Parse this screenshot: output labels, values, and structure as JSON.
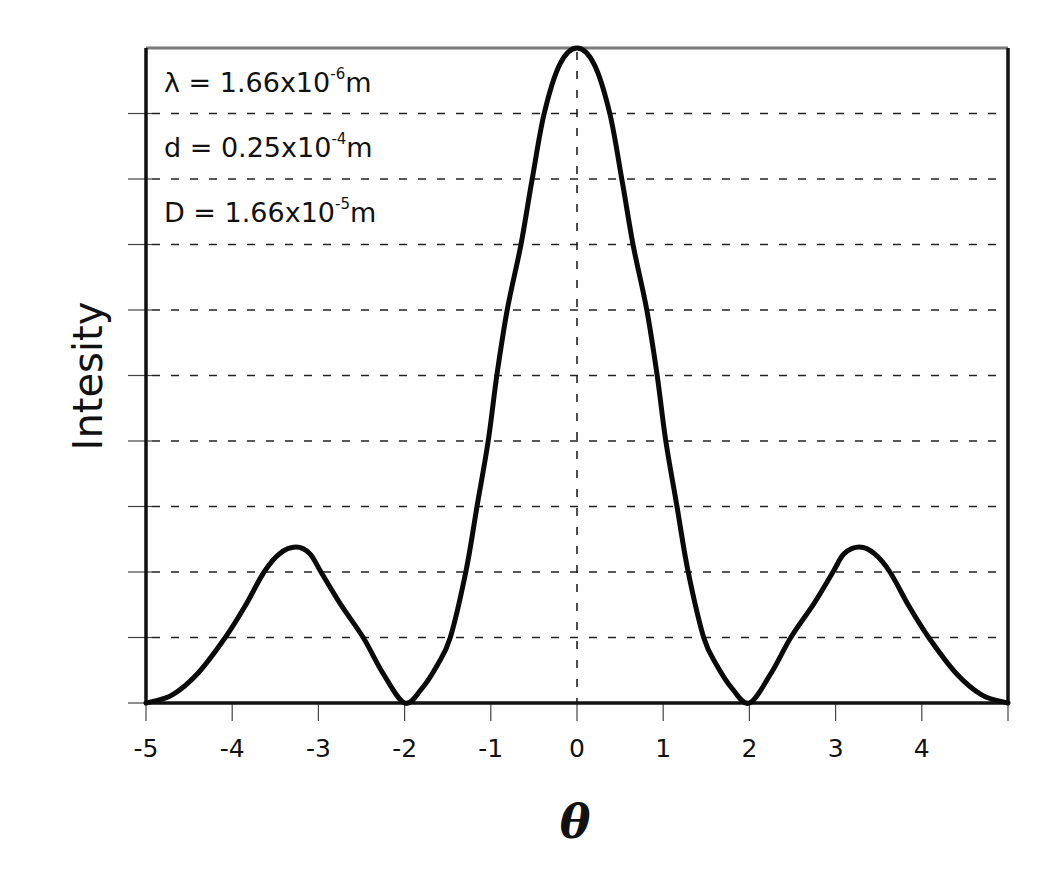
{
  "chart_data": {
    "type": "line",
    "title": "",
    "xlabel": "θ",
    "ylabel": "Intesity",
    "xlim": [
      -5,
      5
    ],
    "ylim": [
      0,
      1
    ],
    "x_ticks": [
      -5,
      -4,
      -3,
      -2,
      -1,
      0,
      1,
      2,
      3,
      4,
      5
    ],
    "x_tick_labels": [
      "-5",
      "-4",
      "-3",
      "-2",
      "-1",
      "0",
      "1",
      "2",
      "3",
      "4",
      ""
    ],
    "y_ticks": [
      0,
      0.1,
      0.2,
      0.3,
      0.4,
      0.5,
      0.6,
      0.7,
      0.8,
      0.9,
      1.0
    ],
    "y_tick_labels": [],
    "grid": {
      "horizontal": true,
      "vertical_at_zero": true,
      "style": "dashed"
    },
    "legend": null,
    "annotations": [
      {
        "symbol": "λ",
        "base": "1.66x10",
        "exp": "-6",
        "unit": "m"
      },
      {
        "symbol": "d",
        "base": "0.25x10",
        "exp": "-4",
        "unit": "m"
      },
      {
        "symbol": "D",
        "base": "1.66x10",
        "exp": "-5",
        "unit": "m"
      }
    ],
    "series": [
      {
        "name": "Intensity",
        "x": [
          -5.0,
          -4.7,
          -4.4,
          -4.08,
          -3.85,
          -3.63,
          -3.45,
          -3.26,
          -3.1,
          -2.97,
          -2.75,
          -2.48,
          -2.25,
          -2.0,
          -1.8,
          -1.62,
          -1.47,
          -1.29,
          -1.16,
          -1.03,
          -0.93,
          -0.81,
          -0.65,
          -0.52,
          -0.38,
          -0.2,
          0.0,
          0.2,
          0.38,
          0.52,
          0.65,
          0.81,
          0.93,
          1.03,
          1.16,
          1.29,
          1.47,
          1.62,
          1.8,
          2.0,
          2.25,
          2.48,
          2.75,
          2.97,
          3.1,
          3.28,
          3.45,
          3.63,
          3.85,
          4.08,
          4.4,
          4.7,
          5.0
        ],
        "y": [
          0.0,
          0.012,
          0.045,
          0.1,
          0.148,
          0.2,
          0.228,
          0.238,
          0.228,
          0.2,
          0.152,
          0.1,
          0.045,
          0.0,
          0.022,
          0.058,
          0.1,
          0.2,
          0.3,
          0.4,
          0.5,
          0.6,
          0.7,
          0.8,
          0.9,
          0.975,
          1.0,
          0.975,
          0.9,
          0.8,
          0.7,
          0.6,
          0.5,
          0.4,
          0.3,
          0.2,
          0.1,
          0.058,
          0.022,
          0.0,
          0.045,
          0.1,
          0.152,
          0.2,
          0.228,
          0.238,
          0.228,
          0.2,
          0.148,
          0.1,
          0.045,
          0.012,
          0.0
        ]
      }
    ]
  },
  "plot": {
    "left": 146,
    "right": 1008,
    "top": 48,
    "bottom": 703,
    "line_color": "#0a0a0a",
    "grid_color": "#222222",
    "frame_color": "#111111",
    "top_border_color": "#7a7a7a"
  }
}
